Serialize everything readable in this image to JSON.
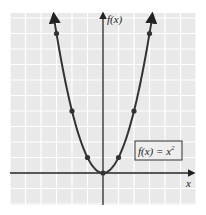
{
  "chart_data": {
    "type": "line",
    "title": "",
    "function_label": "f(x) = x",
    "function_label_exponent": "2",
    "xlabel": "x",
    "ylabel": "f(x)",
    "xlim": [
      -6,
      6
    ],
    "ylim": [
      -2,
      10
    ],
    "grid": true,
    "legend_position": "lower right (boxed annotation)",
    "series": [
      {
        "name": "f(x) = x^2",
        "curve": "parabola",
        "x": [
          -3,
          -2,
          -1,
          0,
          1,
          2,
          3
        ],
        "y": [
          9,
          4,
          1,
          0,
          1,
          4,
          9
        ]
      }
    ],
    "colors": {
      "background": "#e9e9e9",
      "grid": "#ffffff",
      "axis": "#222222",
      "curve": "#333333",
      "point": "#333333"
    }
  }
}
